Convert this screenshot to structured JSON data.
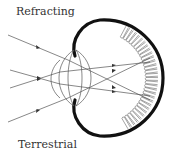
{
  "diagram": {
    "labels": {
      "top": "Refracting",
      "bottom": "Terrestrial"
    },
    "colors": {
      "eye_wall": "#111111",
      "rays": "#555555",
      "lens": "#555555",
      "receptors": "#666666",
      "text": "#333333"
    }
  }
}
